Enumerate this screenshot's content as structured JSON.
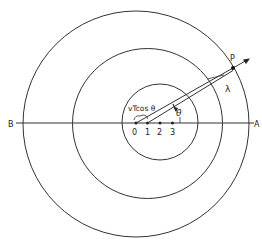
{
  "diagram": {
    "colors": {
      "stroke": "#333333",
      "background": "#ffffff"
    },
    "axis": {
      "left_label": "B",
      "right_label": "A"
    },
    "source_positions": [
      "0",
      "1",
      "2",
      "3"
    ],
    "point_label": "P",
    "wavelength_label": "λ",
    "angle_label": "θ",
    "displacement_label": "vTcos θ",
    "circles": [
      {
        "name": "outer-wavefront",
        "center_point": "0",
        "cx": 136,
        "cy": 124,
        "r": 113
      },
      {
        "name": "middle-wavefront",
        "center_point": "1",
        "cx": 147,
        "cy": 123,
        "r": 75
      },
      {
        "name": "inner-wavefront",
        "center_point": "2",
        "cx": 160,
        "cy": 122,
        "r": 38
      }
    ]
  }
}
